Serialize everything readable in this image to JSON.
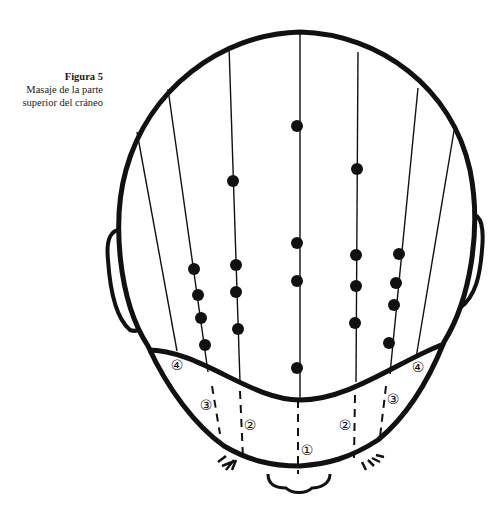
{
  "caption": {
    "title": "Figura 5",
    "line1": "Masaje de la parte",
    "line2": "superior del cráneo"
  },
  "colors": {
    "ink": "#111111",
    "paper": "#ffffff"
  },
  "figure": {
    "meridians": [
      {
        "x1": 300,
        "y1": 34,
        "x2": 300,
        "y2": 400
      },
      {
        "x1": 229,
        "y1": 46,
        "x2": 240,
        "y2": 382
      },
      {
        "x1": 358,
        "y1": 52,
        "x2": 356,
        "y2": 382
      },
      {
        "x1": 168,
        "y1": 89,
        "x2": 208,
        "y2": 372
      },
      {
        "x1": 418,
        "y1": 88,
        "x2": 390,
        "y2": 374
      },
      {
        "x1": 137,
        "y1": 132,
        "x2": 177,
        "y2": 351
      },
      {
        "x1": 455,
        "y1": 125,
        "x2": 416,
        "y2": 358
      }
    ],
    "dots": [
      {
        "x": 297,
        "y": 126
      },
      {
        "x": 297,
        "y": 243
      },
      {
        "x": 297,
        "y": 281
      },
      {
        "x": 297,
        "y": 368
      },
      {
        "x": 233,
        "y": 181
      },
      {
        "x": 236,
        "y": 265
      },
      {
        "x": 236,
        "y": 292
      },
      {
        "x": 238,
        "y": 329
      },
      {
        "x": 357,
        "y": 169
      },
      {
        "x": 356,
        "y": 255
      },
      {
        "x": 356,
        "y": 286
      },
      {
        "x": 355,
        "y": 323
      },
      {
        "x": 194,
        "y": 269
      },
      {
        "x": 198,
        "y": 295
      },
      {
        "x": 201,
        "y": 318
      },
      {
        "x": 205,
        "y": 345
      },
      {
        "x": 399,
        "y": 254
      },
      {
        "x": 396,
        "y": 283
      },
      {
        "x": 394,
        "y": 305
      },
      {
        "x": 389,
        "y": 343
      }
    ],
    "dashed_lines": [
      {
        "x1": 298,
        "y1": 400,
        "x2": 298,
        "y2": 476
      },
      {
        "x1": 240,
        "y1": 391,
        "x2": 243,
        "y2": 458
      },
      {
        "x1": 355,
        "y1": 395,
        "x2": 354,
        "y2": 458
      },
      {
        "x1": 212,
        "y1": 386,
        "x2": 220,
        "y2": 434
      },
      {
        "x1": 386,
        "y1": 386,
        "x2": 380,
        "y2": 437
      }
    ],
    "labels": [
      {
        "text": "①",
        "x": 307,
        "y": 455
      },
      {
        "text": "②",
        "x": 250,
        "y": 430
      },
      {
        "text": "②",
        "x": 345,
        "y": 430
      },
      {
        "text": "③",
        "x": 206,
        "y": 410
      },
      {
        "text": "③",
        "x": 393,
        "y": 404
      },
      {
        "text": "④",
        "x": 177,
        "y": 370
      },
      {
        "text": "④",
        "x": 418,
        "y": 372
      }
    ]
  }
}
